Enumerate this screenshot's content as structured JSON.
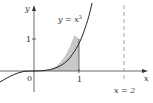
{
  "diagram": {
    "curve_label_lhs": "y",
    "curve_label_eq": " = x",
    "curve_label_exp": "3",
    "x_axis_label": "x",
    "y_axis_label": "y",
    "origin_label": "0",
    "x_tick_1": "1",
    "y_tick_1": "1",
    "vline_label": "x = 2",
    "shaded_region": "area under y = x^3 from x = 0 to x = 1",
    "colors": {
      "axis": "#444444",
      "curve": "#222222",
      "shade": "#c8c8c8",
      "dashed": "#999999"
    }
  }
}
